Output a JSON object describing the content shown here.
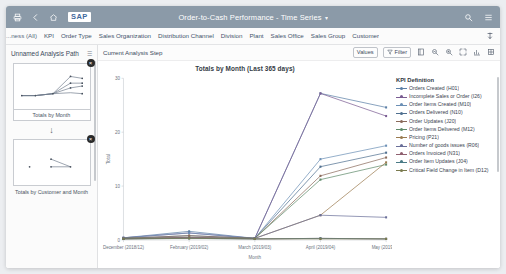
{
  "shell": {
    "icons": {
      "home_back_print": "print-icon",
      "back": "back-icon",
      "home": "home-icon",
      "search": "search-icon",
      "menu": "menu-icon"
    },
    "logo_text": "SAP",
    "title": "Order-to-Cash Performance - Time Series",
    "title_chevron": "▾"
  },
  "dimension_bar": {
    "items": [
      {
        "label": "...ness (All)"
      },
      {
        "label": "KPI"
      },
      {
        "label": "Order Type"
      },
      {
        "label": "Sales Organization"
      },
      {
        "label": "Distribution Channel"
      },
      {
        "label": "Division"
      },
      {
        "label": "Plant"
      },
      {
        "label": "Sales Office"
      },
      {
        "label": "Sales Group"
      },
      {
        "label": "Customer"
      }
    ],
    "action_icon": "expand-collapse-icon"
  },
  "sidebar": {
    "title": "Unnamed Analysis Path",
    "menu_icon": "overflow-menu-icon",
    "nodes": [
      {
        "label": "Totals by Month",
        "close_icon": "×"
      },
      {
        "label": "Totals by Customer and Month",
        "close_icon": "×"
      }
    ],
    "arrow": "↓"
  },
  "toolbar": {
    "title": "Current Analysis Step",
    "values_label": "Values",
    "filter_label": "Filter",
    "icons": [
      "legend-icon",
      "zoom-out-icon",
      "zoom-in-icon",
      "fullscreen-icon",
      "chart-type-icon",
      "settings-grid-icon"
    ]
  },
  "legend": {
    "title": "KPI Definition",
    "items": [
      {
        "label": "Orders Created (H01)",
        "color": "#5b7fa6"
      },
      {
        "label": "Incomplete Sales or Order (I26)",
        "color": "#7a5c92"
      },
      {
        "label": "Order Items Created (M10)",
        "color": "#6b8fb5"
      },
      {
        "label": "Orders Delivered (N10)",
        "color": "#4f6f8f"
      },
      {
        "label": "Order Updates (J20)",
        "color": "#8a6a5a"
      },
      {
        "label": "Order Items Delivered (M12)",
        "color": "#5f8a6a"
      },
      {
        "label": "Pricing (P21)",
        "color": "#9a7b4f"
      },
      {
        "label": "Number of goods issues (R06)",
        "color": "#6a6f99"
      },
      {
        "label": "Orders Invoiced (N31)",
        "color": "#8f5f6f"
      },
      {
        "label": "Order Item Updates (J04)",
        "color": "#4a7a86"
      },
      {
        "label": "Critical Field Change in Item (D12)",
        "color": "#7b7b4f"
      }
    ]
  },
  "chart_data": {
    "type": "line",
    "title": "Totals by Month (Last 365 days)",
    "xlabel": "Month",
    "ylabel": "Total",
    "ylim": [
      0,
      30
    ],
    "yticks": [
      0,
      10,
      20,
      30
    ],
    "grid": false,
    "legend_position": "right",
    "categories": [
      "December (2018/12)",
      "February (2019/02)",
      "March (2019/03)",
      "April (2019/04)",
      "May (2019/05)"
    ],
    "series": [
      {
        "name": "Orders Created (H01)",
        "values": [
          0.4,
          1.6,
          0.3,
          27.2,
          24.6
        ]
      },
      {
        "name": "Incomplete Sales or Order (I26)",
        "values": [
          0.4,
          1.3,
          0.3,
          27.2,
          23.0
        ]
      },
      {
        "name": "Order Items Created (M10)",
        "values": [
          0.4,
          1.3,
          0.3,
          15.0,
          17.5
        ]
      },
      {
        "name": "Orders Delivered (N10)",
        "values": [
          0.3,
          0.8,
          0.3,
          13.6,
          16.2
        ]
      },
      {
        "name": "Order Updates (J20)",
        "values": [
          0.3,
          0.8,
          0.3,
          11.9,
          15.3
        ]
      },
      {
        "name": "Order Items Delivered (M12)",
        "values": [
          0.3,
          0.5,
          0.3,
          11.2,
          14.0
        ]
      },
      {
        "name": "Pricing (P21)",
        "values": [
          0.3,
          0.5,
          0.3,
          4.6,
          14.4
        ]
      },
      {
        "name": "Number of goods issues (R06)",
        "values": [
          0.3,
          0.4,
          0.3,
          4.6,
          4.2
        ]
      },
      {
        "name": "Orders Invoiced (N31)",
        "values": [
          0.2,
          0.4,
          0.2,
          0.3,
          0.2
        ]
      },
      {
        "name": "Order Item Updates (J04)",
        "values": [
          0.2,
          0.3,
          0.2,
          0.3,
          0.2
        ]
      },
      {
        "name": "Critical Field Change in Item (D12)",
        "values": [
          0.2,
          0.3,
          0.2,
          0.2,
          0.2
        ]
      }
    ]
  }
}
